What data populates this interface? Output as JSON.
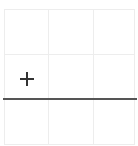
{
  "canvas": {
    "grid": {
      "rows": 3,
      "columns": 3,
      "line_color": "#ededed"
    },
    "baseline": {
      "color": "#555555"
    },
    "add_icon": {
      "icon": "plus-icon",
      "color": "#333333"
    }
  }
}
